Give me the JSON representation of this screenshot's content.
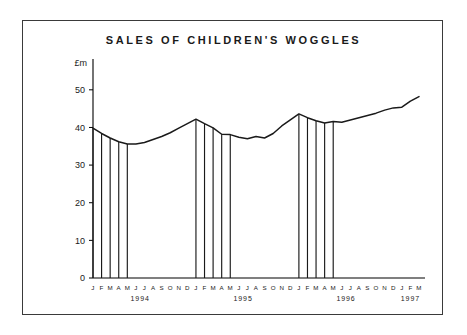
{
  "chart_data": {
    "type": "line",
    "title": "SALES OF CHILDREN'S WOGGLES",
    "xlabel": "",
    "ylabel": "£m",
    "ylim": [
      0,
      55
    ],
    "yticks": [
      0,
      10,
      20,
      30,
      40,
      50
    ],
    "ytick_labels": [
      "0",
      "10",
      "20",
      "30",
      "40",
      "50"
    ],
    "grid": false,
    "legend": null,
    "month_initials": [
      "J",
      "F",
      "M",
      "A",
      "M",
      "J",
      "J",
      "A",
      "S",
      "O",
      "N",
      "D"
    ],
    "years": [
      {
        "label": "1994",
        "months": 12
      },
      {
        "label": "1995",
        "months": 12
      },
      {
        "label": "1996",
        "months": 12
      },
      {
        "label": "1997",
        "months": 3
      }
    ],
    "x": [
      "1994-J",
      "1994-F",
      "1994-M",
      "1994-A",
      "1994-M",
      "1994-J",
      "1994-J",
      "1994-A",
      "1994-S",
      "1994-O",
      "1994-N",
      "1994-D",
      "1995-J",
      "1995-F",
      "1995-M",
      "1995-A",
      "1995-M",
      "1995-J",
      "1995-J",
      "1995-A",
      "1995-S",
      "1995-O",
      "1995-N",
      "1995-D",
      "1996-J",
      "1996-F",
      "1996-M",
      "1996-A",
      "1996-M",
      "1996-J",
      "1996-J",
      "1996-A",
      "1996-S",
      "1996-O",
      "1996-N",
      "1996-D",
      "1997-J",
      "1997-F",
      "1997-M"
    ],
    "values": [
      39.8,
      38.4,
      37.2,
      36.2,
      35.6,
      35.6,
      36.0,
      36.8,
      37.6,
      38.6,
      39.8,
      41.0,
      42.2,
      41.0,
      39.9,
      38.2,
      38.1,
      37.4,
      37.0,
      37.6,
      37.2,
      38.4,
      40.4,
      42.0,
      43.6,
      42.6,
      41.8,
      41.2,
      41.6,
      41.4,
      42.0,
      42.6,
      43.2,
      43.8,
      44.6,
      45.2,
      45.4,
      47.0,
      48.2
    ],
    "shaded_groups": [
      {
        "year": "1994",
        "start_index": 0,
        "end_index": 4
      },
      {
        "year": "1995",
        "start_index": 12,
        "end_index": 16
      },
      {
        "year": "1996",
        "start_index": 24,
        "end_index": 28
      }
    ]
  },
  "colors": {
    "line": "#1a1a1a",
    "axis": "#000000",
    "frame": "#3a3a3a",
    "background": "#ffffff"
  }
}
